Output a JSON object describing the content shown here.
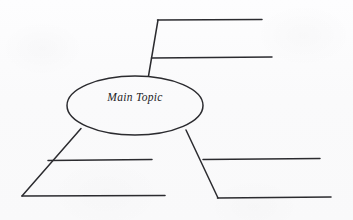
{
  "document": {
    "type": "concept-map-worksheet",
    "title": "Main Topic",
    "background_color": "#fbfbfc",
    "ink_color": "#2b2b2f"
  },
  "central_node": {
    "shape": "ellipse",
    "label": "Main Topic",
    "center_x": 135,
    "center_y": 105,
    "radius_x": 68,
    "radius_y": 29
  },
  "branches": [
    {
      "name": "upper-right-branch",
      "connector_label": "",
      "blank_lines": [
        {
          "name": "upper-right-line-1",
          "label": ""
        },
        {
          "name": "upper-right-line-2",
          "label": ""
        }
      ]
    },
    {
      "name": "lower-left-branch",
      "connector_label": "",
      "blank_lines": [
        {
          "name": "lower-left-line-1",
          "label": ""
        },
        {
          "name": "lower-left-line-2",
          "label": ""
        }
      ]
    },
    {
      "name": "lower-right-branch",
      "connector_label": "",
      "blank_lines": [
        {
          "name": "lower-right-line-1",
          "label": ""
        },
        {
          "name": "lower-right-line-2",
          "label": ""
        }
      ]
    }
  ],
  "geometry": {
    "upper_right": {
      "connector": "M 148,76 L 158,20",
      "line_1": "M 158,20 L 262,20",
      "line_2": "M 152,58 L 272,58"
    },
    "lower_left": {
      "connector": "M 81,128 L 22,196",
      "line_1": "M 22,196 L 165,196",
      "line_2": "M 48,160 L 152,160"
    },
    "lower_right": {
      "connector": "M 186,130 L 218,198",
      "line_1": "M 218,198 L 331,198",
      "line_2": "M 203,159 L 320,159"
    }
  }
}
